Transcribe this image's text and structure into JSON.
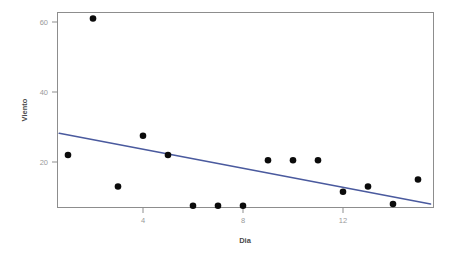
{
  "chart_data": {
    "type": "scatter",
    "title": "",
    "xlabel": "Dia",
    "ylabel": "Viento",
    "xlim": [
      0.4,
      15.6
    ],
    "ylim": [
      5.0,
      63.5
    ],
    "xticks": [
      4,
      8,
      12
    ],
    "xtick_labels": [
      "4",
      "8",
      "12"
    ],
    "yticks": [
      20,
      40,
      60
    ],
    "ytick_labels": [
      "20",
      "40",
      "60"
    ],
    "grid": false,
    "legend": "none",
    "point_color": "#0b0b0b",
    "line_color": "#4a5a9e",
    "panel_color": "#ffffff",
    "border_color": "#8d8d8d",
    "x": [
      1,
      2,
      3,
      4,
      5,
      6,
      7,
      8,
      9,
      10,
      11,
      12,
      13,
      14,
      15
    ],
    "y": [
      22.0,
      61.0,
      13.0,
      27.5,
      22.0,
      7.5,
      7.5,
      7.5,
      20.5,
      20.5,
      20.5,
      11.5,
      13.0,
      8.0,
      15.0
    ],
    "points": [
      {
        "x": 1,
        "y": 22.0
      },
      {
        "x": 2,
        "y": 61.0
      },
      {
        "x": 3,
        "y": 13.0
      },
      {
        "x": 4,
        "y": 27.5
      },
      {
        "x": 5,
        "y": 22.0
      },
      {
        "x": 6,
        "y": 7.5
      },
      {
        "x": 7,
        "y": 7.5
      },
      {
        "x": 8,
        "y": 7.5
      },
      {
        "x": 9,
        "y": 20.5
      },
      {
        "x": 10,
        "y": 20.5
      },
      {
        "x": 11,
        "y": 20.5
      },
      {
        "x": 12,
        "y": 11.5
      },
      {
        "x": 13,
        "y": 13.0
      },
      {
        "x": 14,
        "y": 8.0
      },
      {
        "x": 15,
        "y": 15.0
      }
    ],
    "series": [
      {
        "name": "Viento",
        "type": "scatter",
        "values": [
          22.0,
          61.0,
          13.0,
          27.5,
          22.0,
          7.5,
          7.5,
          7.5,
          20.5,
          20.5,
          20.5,
          11.5,
          13.0,
          8.0,
          15.0
        ]
      },
      {
        "name": "trend-line",
        "type": "line",
        "x_start": 0.65,
        "y_start": 28.2,
        "x_end": 15.5,
        "y_end": 8.0
      }
    ]
  }
}
